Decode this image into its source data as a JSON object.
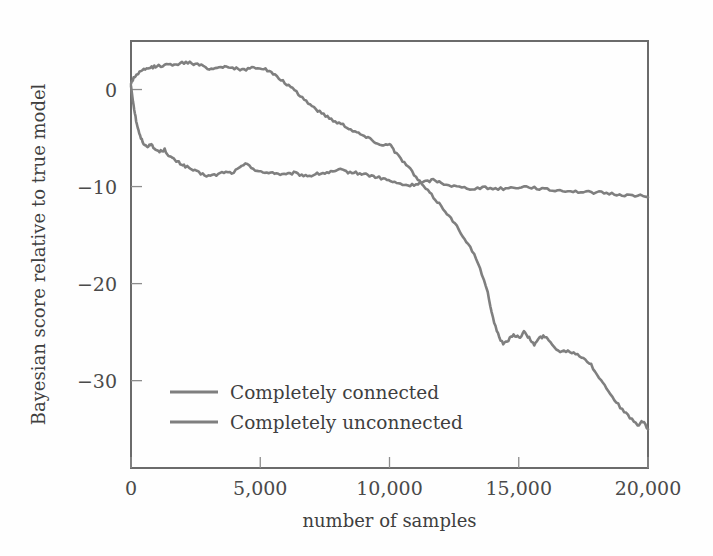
{
  "figure": {
    "background_color": "#fefefe",
    "frame_color": "#6b6b6b",
    "text_color": "#3f3f3f"
  },
  "chart_data": {
    "type": "line",
    "title": "",
    "xlabel": "number of samples",
    "ylabel": "Bayesian score relative to true model",
    "xlim": [
      0,
      20000
    ],
    "ylim": [
      -39,
      5
    ],
    "grid": false,
    "legend_position": "lower-left-inside",
    "xticks": [
      0,
      5000,
      10000,
      15000,
      20000
    ],
    "xticklabels": [
      "0",
      "5,000",
      "10,000",
      "15,000",
      "20,000"
    ],
    "yticks": [
      0,
      -10,
      -20,
      -30
    ],
    "yticklabels": [
      "0",
      "−10",
      "−20",
      "−30"
    ],
    "series": [
      {
        "name": "Completely connected",
        "color": "#7f7f7f",
        "x": [
          0,
          100,
          200,
          320,
          450,
          600,
          750,
          900,
          1100,
          1300,
          1500,
          1700,
          1900,
          2100,
          2400,
          2700,
          3000,
          3300,
          3600,
          3900,
          4200,
          4500,
          4800,
          5100,
          5400,
          5700,
          6000,
          6300,
          6600,
          6900,
          7200,
          7500,
          7800,
          8100,
          8400,
          8700,
          9000,
          9300,
          9600,
          9900,
          10200,
          10500,
          10800,
          11100,
          11400,
          11700,
          12000,
          12400,
          12800,
          13200,
          13600,
          14000,
          14400,
          14800,
          15200,
          15600,
          16000,
          16400,
          16800,
          17200,
          17600,
          18000,
          18400,
          18800,
          19200,
          19600,
          20000
        ],
        "y": [
          0.4,
          -1.6,
          -3.2,
          -4.6,
          -5.4,
          -5.9,
          -5.6,
          -6.1,
          -6.4,
          -6.2,
          -6.9,
          -7.3,
          -7.6,
          -7.9,
          -8.3,
          -8.7,
          -8.9,
          -8.8,
          -8.5,
          -8.6,
          -8.1,
          -7.6,
          -8.3,
          -8.6,
          -8.5,
          -8.7,
          -8.8,
          -8.6,
          -8.8,
          -8.9,
          -8.7,
          -8.6,
          -8.5,
          -8.3,
          -8.5,
          -8.6,
          -8.7,
          -8.9,
          -9.1,
          -9.3,
          -9.6,
          -9.8,
          -9.9,
          -9.7,
          -9.5,
          -9.3,
          -9.6,
          -9.9,
          -10.1,
          -10.2,
          -10.1,
          -10.2,
          -10.2,
          -10.1,
          -10.0,
          -10.1,
          -10.3,
          -10.4,
          -10.4,
          -10.5,
          -10.6,
          -10.6,
          -10.7,
          -10.8,
          -10.9,
          -10.9,
          -11.1
        ]
      },
      {
        "name": "Completely unconnected",
        "color": "#7f7f7f",
        "x": [
          0,
          100,
          250,
          400,
          600,
          800,
          1000,
          1300,
          1600,
          1900,
          2200,
          2500,
          2800,
          3100,
          3400,
          3700,
          4000,
          4300,
          4600,
          4900,
          5200,
          5500,
          5800,
          6100,
          6400,
          6700,
          7000,
          7300,
          7600,
          7900,
          8200,
          8500,
          8800,
          9100,
          9400,
          9700,
          10000,
          10200,
          10500,
          10800,
          11100,
          11400,
          11700,
          12000,
          12300,
          12600,
          12900,
          13200,
          13500,
          13800,
          14000,
          14200,
          14400,
          14600,
          14800,
          15000,
          15200,
          15400,
          15600,
          15800,
          16000,
          16300,
          16600,
          16900,
          17200,
          17500,
          17800,
          18100,
          18400,
          18700,
          19000,
          19300,
          19600,
          19800,
          20000
        ],
        "y": [
          0.6,
          1.2,
          1.6,
          1.9,
          2.1,
          2.3,
          2.4,
          2.5,
          2.6,
          2.7,
          2.8,
          2.6,
          2.4,
          2.1,
          2.3,
          2.4,
          2.2,
          2.0,
          2.2,
          2.3,
          2.1,
          1.6,
          1.0,
          0.4,
          -0.3,
          -1.0,
          -1.7,
          -2.3,
          -2.8,
          -3.3,
          -3.6,
          -4.1,
          -4.5,
          -4.9,
          -5.3,
          -5.8,
          -5.5,
          -6.4,
          -7.3,
          -8.2,
          -9.3,
          -10.2,
          -11.1,
          -12.0,
          -13.0,
          -14.1,
          -15.3,
          -16.6,
          -18.4,
          -21.0,
          -23.5,
          -25.2,
          -26.3,
          -25.8,
          -25.2,
          -25.6,
          -25.0,
          -25.6,
          -26.3,
          -25.6,
          -25.4,
          -26.3,
          -27.0,
          -26.9,
          -27.2,
          -27.6,
          -28.4,
          -29.6,
          -30.8,
          -31.9,
          -33.0,
          -33.8,
          -34.6,
          -34.2,
          -35.0
        ]
      }
    ]
  },
  "legend": {
    "items": [
      {
        "label": "Completely connected",
        "color": "#7f7f7f"
      },
      {
        "label": "Completely unconnected",
        "color": "#7f7f7f"
      }
    ]
  }
}
